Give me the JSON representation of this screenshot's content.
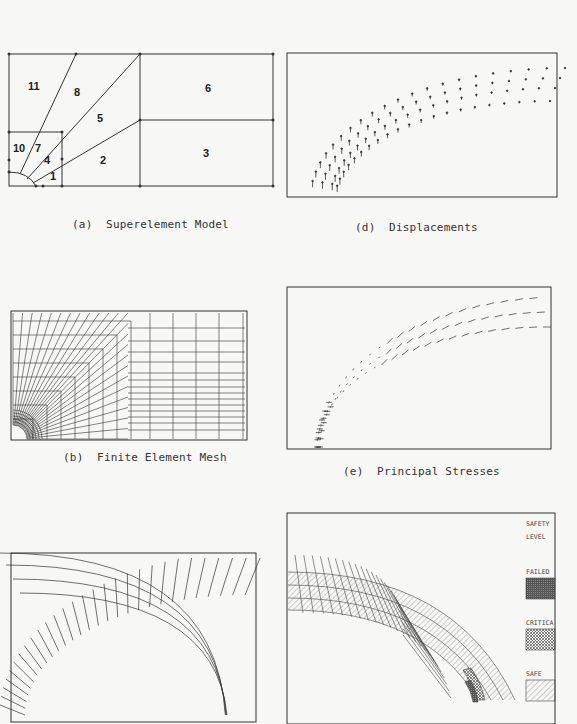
{
  "figure": {
    "panels": [
      {
        "id": "a",
        "caption": "(a)  Superelement Model",
        "superelement_labels": [
          "1",
          "2",
          "3",
          "4",
          "5",
          "6",
          "7",
          "8",
          "10",
          "11"
        ]
      },
      {
        "id": "b",
        "caption": "(b)  Finite Element Mesh"
      },
      {
        "id": "c",
        "caption": ""
      },
      {
        "id": "d",
        "caption": "(d)  Displacements"
      },
      {
        "id": "e",
        "caption": "(e)  Principal Stresses"
      },
      {
        "id": "f",
        "caption": "",
        "legend": {
          "title_line1": "SAFETY",
          "title_line2": "LEVEL",
          "items": [
            {
              "label": "FAILED",
              "pattern": "dense-crosshatch",
              "color": "#555555"
            },
            {
              "label": "CRITICA",
              "pattern": "crosshatch",
              "color": "#888888"
            },
            {
              "label": "SAFE",
              "pattern": "diagonal-hatch",
              "color": "#999999"
            }
          ]
        }
      }
    ]
  }
}
